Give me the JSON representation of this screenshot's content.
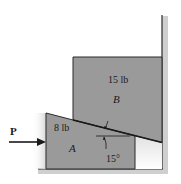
{
  "figure": {
    "force": {
      "label": "P",
      "direction": "right"
    },
    "block_a": {
      "weight": "8 lb",
      "name": "A"
    },
    "block_b": {
      "weight": "15 lb",
      "name": "B"
    },
    "angle": {
      "label": "15°",
      "degrees": 15
    },
    "colors": {
      "block_fill": "#9a9a9a",
      "edge": "#2a2a2a",
      "ground_hatch": "#c8c8c8",
      "background": "#ffffff"
    }
  }
}
